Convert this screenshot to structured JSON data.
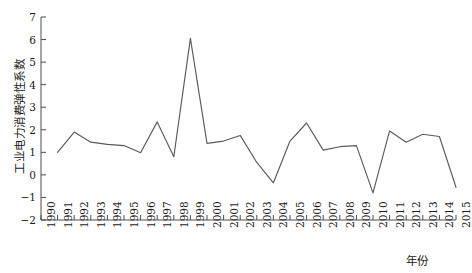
{
  "chart_data": {
    "type": "line",
    "title": "",
    "subtitle": "",
    "xlabel": "年份",
    "ylabel": "工业电力消费弹性系数",
    "xlim": [
      1990,
      2015
    ],
    "ylim": [
      -2,
      7
    ],
    "yticks": [
      7,
      6,
      5,
      4,
      3,
      2,
      1,
      0,
      -1,
      -2
    ],
    "ytick_labels": [
      "7",
      "6",
      "5",
      "4",
      "3",
      "2",
      "1",
      "0",
      "-1",
      "-2"
    ],
    "grid": false,
    "legend": null,
    "legend_position": "none",
    "line_color": "#5a5a5a",
    "categories": [
      "1990",
      "1991",
      "1992",
      "1993",
      "1994",
      "1995",
      "1996",
      "1997",
      "1998",
      "1999",
      "2000",
      "2001",
      "2002",
      "2003",
      "2004",
      "2005",
      "2006",
      "2007",
      "2008",
      "2009",
      "2010",
      "2011",
      "2012",
      "2013",
      "2014",
      "2015"
    ],
    "series": [
      {
        "name": "工业电力消费弹性系数",
        "x": [
          1991,
          1992,
          1993,
          1994,
          1995,
          1996,
          1997,
          1998,
          1999,
          2000,
          2001,
          2002,
          2003,
          2004,
          2005,
          2006,
          2007,
          2008,
          2009,
          2010,
          2011,
          2012,
          2013,
          2014,
          2015
        ],
        "values": [
          1.0,
          1.9,
          1.45,
          1.35,
          1.3,
          0.98,
          2.35,
          0.8,
          6.05,
          1.4,
          1.5,
          1.75,
          0.55,
          -0.35,
          1.5,
          2.3,
          1.1,
          1.25,
          1.3,
          -0.8,
          1.95,
          1.45,
          1.8,
          1.7,
          -0.55
        ]
      }
    ]
  }
}
